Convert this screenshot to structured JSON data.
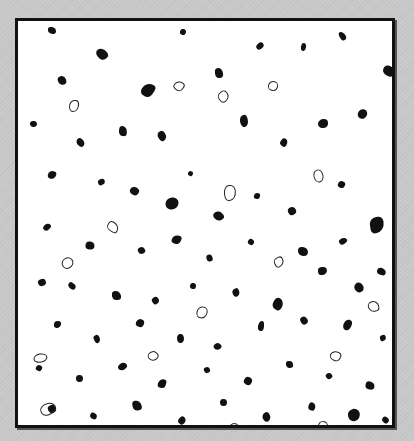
{
  "image": {
    "description": "Black-and-white micrograph of dispersed particles inside a black frame",
    "background_color": "#c9c9c9",
    "frame_color": "#111111",
    "field_color": "#ffffff",
    "particle_color": "#111111"
  },
  "specks": [
    [
      30,
      6,
      8,
      7,
      0
    ],
    [
      78,
      28,
      12,
      10,
      0
    ],
    [
      162,
      8,
      6,
      6,
      0
    ],
    [
      40,
      55,
      8,
      9,
      0
    ],
    [
      124,
      62,
      12,
      14,
      0
    ],
    [
      196,
      48,
      10,
      8,
      0
    ],
    [
      238,
      22,
      8,
      6,
      0
    ],
    [
      283,
      22,
      5,
      8,
      0
    ],
    [
      320,
      12,
      9,
      6,
      0
    ],
    [
      366,
      44,
      10,
      12,
      0
    ],
    [
      12,
      100,
      7,
      6,
      0
    ],
    [
      58,
      118,
      9,
      7,
      0
    ],
    [
      100,
      106,
      10,
      8,
      0
    ],
    [
      140,
      110,
      8,
      10,
      0
    ],
    [
      170,
      150,
      5,
      5,
      0
    ],
    [
      220,
      96,
      12,
      8,
      0
    ],
    [
      262,
      118,
      8,
      7,
      0
    ],
    [
      300,
      98,
      10,
      9,
      0
    ],
    [
      340,
      88,
      9,
      10,
      0
    ],
    [
      30,
      150,
      8,
      8,
      0
    ],
    [
      80,
      158,
      7,
      6,
      0
    ],
    [
      112,
      166,
      9,
      8,
      0
    ],
    [
      148,
      176,
      12,
      13,
      0
    ],
    [
      196,
      190,
      9,
      10,
      0
    ],
    [
      236,
      172,
      6,
      6,
      0
    ],
    [
      270,
      186,
      8,
      8,
      0
    ],
    [
      320,
      160,
      7,
      7,
      0
    ],
    [
      352,
      196,
      14,
      16,
      0
    ],
    [
      26,
      202,
      6,
      8,
      0
    ],
    [
      68,
      220,
      8,
      9,
      0
    ],
    [
      120,
      226,
      7,
      7,
      0
    ],
    [
      154,
      214,
      9,
      9,
      0
    ],
    [
      188,
      234,
      7,
      6,
      0
    ],
    [
      230,
      218,
      6,
      6,
      0
    ],
    [
      280,
      226,
      10,
      9,
      0
    ],
    [
      322,
      216,
      6,
      8,
      0
    ],
    [
      360,
      246,
      7,
      9,
      0
    ],
    [
      20,
      258,
      8,
      7,
      0
    ],
    [
      50,
      262,
      8,
      6,
      0
    ],
    [
      94,
      270,
      9,
      9,
      0
    ],
    [
      134,
      276,
      7,
      7,
      0
    ],
    [
      172,
      262,
      6,
      6,
      0
    ],
    [
      214,
      268,
      8,
      7,
      0
    ],
    [
      254,
      278,
      12,
      10,
      0
    ],
    [
      300,
      246,
      9,
      8,
      0
    ],
    [
      336,
      262,
      10,
      9,
      0
    ],
    [
      36,
      300,
      7,
      7,
      0
    ],
    [
      76,
      314,
      6,
      8,
      0
    ],
    [
      118,
      298,
      8,
      8,
      0
    ],
    [
      158,
      314,
      9,
      7,
      0
    ],
    [
      196,
      322,
      7,
      7,
      0
    ],
    [
      240,
      300,
      6,
      10,
      0
    ],
    [
      282,
      296,
      8,
      7,
      0
    ],
    [
      324,
      300,
      11,
      8,
      0
    ],
    [
      362,
      314,
      6,
      6,
      0
    ],
    [
      18,
      344,
      6,
      6,
      0
    ],
    [
      58,
      354,
      7,
      7,
      0
    ],
    [
      100,
      342,
      9,
      7,
      0
    ],
    [
      140,
      358,
      8,
      9,
      0
    ],
    [
      186,
      346,
      6,
      6,
      0
    ],
    [
      226,
      356,
      8,
      8,
      0
    ],
    [
      268,
      340,
      7,
      7,
      0
    ],
    [
      308,
      352,
      6,
      6,
      0
    ],
    [
      348,
      360,
      8,
      9,
      0
    ],
    [
      30,
      384,
      8,
      8,
      0
    ],
    [
      72,
      392,
      7,
      6,
      0
    ],
    [
      114,
      380,
      10,
      9,
      0
    ],
    [
      160,
      396,
      8,
      7,
      0
    ],
    [
      202,
      378,
      7,
      7,
      0
    ],
    [
      244,
      392,
      9,
      8,
      0
    ],
    [
      290,
      382,
      8,
      7,
      0
    ],
    [
      330,
      388,
      12,
      12,
      0
    ],
    [
      364,
      396,
      7,
      6,
      0
    ],
    [
      50,
      80,
      10,
      8,
      1
    ],
    [
      200,
      70,
      9,
      9,
      1
    ],
    [
      250,
      60,
      8,
      8,
      1
    ],
    [
      294,
      150,
      11,
      8,
      1
    ],
    [
      90,
      200,
      8,
      10,
      1
    ],
    [
      206,
      164,
      10,
      14,
      1
    ],
    [
      44,
      236,
      9,
      10,
      1
    ],
    [
      178,
      286,
      10,
      9,
      1
    ],
    [
      256,
      236,
      8,
      8,
      1
    ],
    [
      312,
      330,
      9,
      8,
      1
    ],
    [
      18,
      330,
      7,
      12,
      1
    ],
    [
      130,
      330,
      8,
      8,
      1
    ],
    [
      210,
      402,
      8,
      10,
      1
    ],
    [
      24,
      380,
      10,
      14,
      1
    ],
    [
      300,
      400,
      8,
      8,
      1
    ],
    [
      350,
      280,
      9,
      9,
      1
    ],
    [
      156,
      60,
      8,
      8,
      1
    ]
  ]
}
